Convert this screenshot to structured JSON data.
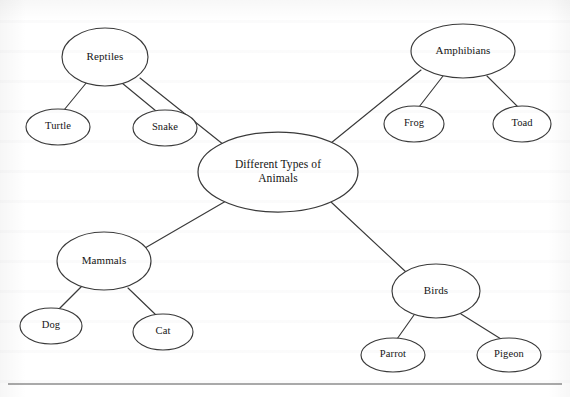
{
  "diagram": {
    "kind": "concept-map",
    "root": {
      "id": "root",
      "label_line1": "Different Types of",
      "label_line2": "Animals",
      "cx": 278,
      "cy": 172,
      "rx": 80,
      "ry": 40
    },
    "branches": [
      {
        "id": "reptiles",
        "label": "Reptiles",
        "cx": 105,
        "cy": 57,
        "rx": 43,
        "ry": 29,
        "children": [
          {
            "id": "turtle",
            "label": "Turtle",
            "cx": 58,
            "cy": 127,
            "rx": 32,
            "ry": 18
          },
          {
            "id": "snake",
            "label": "Snake",
            "cx": 165,
            "cy": 128,
            "rx": 32,
            "ry": 18
          }
        ]
      },
      {
        "id": "amphibians",
        "label": "Amphibians",
        "cx": 463,
        "cy": 51,
        "rx": 52,
        "ry": 27,
        "children": [
          {
            "id": "frog",
            "label": "Frog",
            "cx": 414,
            "cy": 124,
            "rx": 30,
            "ry": 18
          },
          {
            "id": "toad",
            "label": "Toad",
            "cx": 522,
            "cy": 124,
            "rx": 29,
            "ry": 18
          }
        ]
      },
      {
        "id": "mammals",
        "label": "Mammals",
        "cx": 104,
        "cy": 261,
        "rx": 47,
        "ry": 29,
        "children": [
          {
            "id": "dog",
            "label": "Dog",
            "cx": 51,
            "cy": 326,
            "rx": 31,
            "ry": 18
          },
          {
            "id": "cat",
            "label": "Cat",
            "cx": 163,
            "cy": 332,
            "rx": 30,
            "ry": 18
          }
        ]
      },
      {
        "id": "birds",
        "label": "Birds",
        "cx": 436,
        "cy": 291,
        "rx": 44,
        "ry": 27,
        "children": [
          {
            "id": "parrot",
            "label": "Parrot",
            "cx": 393,
            "cy": 355,
            "rx": 32,
            "ry": 17
          },
          {
            "id": "pigeon",
            "label": "Pigeon",
            "cx": 509,
            "cy": 355,
            "rx": 32,
            "ry": 17
          }
        ]
      }
    ],
    "connectors": [
      {
        "id": "root-reptiles",
        "x1": 224,
        "y1": 145,
        "x2": 140,
        "y2": 78
      },
      {
        "id": "root-amphibians",
        "x1": 331,
        "y1": 143,
        "x2": 421,
        "y2": 70
      },
      {
        "id": "root-mammals",
        "x1": 226,
        "y1": 201,
        "x2": 145,
        "y2": 248
      },
      {
        "id": "root-birds",
        "x1": 331,
        "y1": 202,
        "x2": 406,
        "y2": 272
      },
      {
        "id": "reptiles-turtle",
        "x1": 87,
        "y1": 82,
        "x2": 64,
        "y2": 110
      },
      {
        "id": "reptiles-snake",
        "x1": 122,
        "y1": 83,
        "x2": 156,
        "y2": 111
      },
      {
        "id": "amphibians-frog",
        "x1": 443,
        "y1": 76,
        "x2": 419,
        "y2": 107
      },
      {
        "id": "amphibians-toad",
        "x1": 487,
        "y1": 76,
        "x2": 518,
        "y2": 107
      },
      {
        "id": "mammals-dog",
        "x1": 81,
        "y1": 287,
        "x2": 58,
        "y2": 310
      },
      {
        "id": "mammals-cat",
        "x1": 128,
        "y1": 288,
        "x2": 156,
        "y2": 315
      },
      {
        "id": "birds-parrot",
        "x1": 414,
        "y1": 315,
        "x2": 397,
        "y2": 339
      },
      {
        "id": "birds-pigeon",
        "x1": 461,
        "y1": 314,
        "x2": 501,
        "y2": 339
      }
    ],
    "rule": {
      "id": "bottom-rule",
      "x1": 8,
      "y1": 384,
      "x2": 562,
      "y2": 384
    },
    "colors": {
      "stroke": "#3a3a3a",
      "rule": "#555555",
      "text": "#141414",
      "background": "#ffffff"
    }
  }
}
